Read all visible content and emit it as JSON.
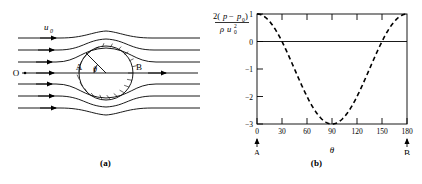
{
  "panel_a": {
    "caption": "(a)",
    "labels": {
      "freestream": "u",
      "freestream_sub": "0",
      "origin": "O",
      "front_point": "A",
      "rear_point": "B",
      "angle": "θ"
    },
    "streamline_count": 7,
    "cylinder": {
      "hatched": true
    }
  },
  "panel_b": {
    "caption": "(b)",
    "ylabel": {
      "numerator_prefix": "2(",
      "numerator_p": "p",
      "numerator_minus": "−",
      "numerator_p0": "p",
      "numerator_p0_sub": "0",
      "numerator_suffix": ")",
      "denominator_rho": "ρ",
      "denominator_u": "u",
      "denominator_sub": "0",
      "denominator_sup": "2"
    },
    "xlabel": "θ",
    "axis_endpoints": {
      "left": "A",
      "right": "B"
    }
  },
  "chart_data": {
    "type": "line",
    "title": "",
    "xlabel": "θ",
    "ylabel": "2(p − p₀) / ρu₀²",
    "xlim": [
      0,
      180
    ],
    "ylim": [
      -3,
      1
    ],
    "xticks": [
      0,
      30,
      60,
      90,
      120,
      150,
      180
    ],
    "xticklabels": [
      "0",
      "30",
      "60",
      "90",
      "120",
      "150",
      "180"
    ],
    "yticks": [
      1,
      0,
      -1,
      -2,
      -3
    ],
    "yticklabels": [
      "1",
      "0",
      "−1",
      "−2",
      "−3"
    ],
    "grid": false,
    "legend": false,
    "linestyle": "dashed",
    "equation": "Cp = 1 - 4 sin^2(theta)",
    "reference_line": {
      "y": 0,
      "style": "solid"
    },
    "x": [
      0,
      10,
      20,
      30,
      40,
      50,
      60,
      70,
      80,
      90,
      100,
      110,
      120,
      130,
      140,
      150,
      160,
      170,
      180
    ],
    "values": [
      1.0,
      0.88,
      0.53,
      0.0,
      -0.65,
      -1.35,
      -2.0,
      -2.53,
      -2.88,
      -3.0,
      -2.88,
      -2.53,
      -2.0,
      -1.35,
      -0.65,
      0.0,
      0.53,
      0.88,
      1.0
    ],
    "annotations": [
      {
        "text": "A",
        "x": 0,
        "note": "front stagnation point"
      },
      {
        "text": "B",
        "x": 180,
        "note": "rear stagnation point"
      }
    ]
  }
}
